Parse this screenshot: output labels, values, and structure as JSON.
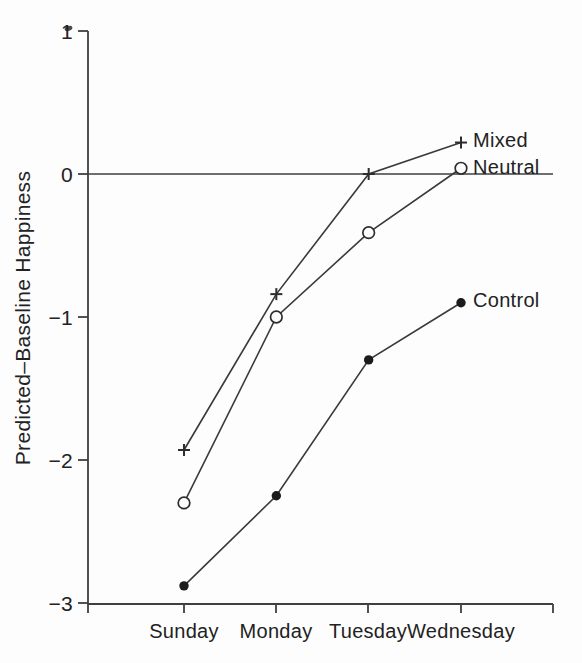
{
  "chart_data": {
    "type": "line",
    "title": "",
    "xlabel": "",
    "ylabel": "Predicted–Baseline Happiness",
    "categories": [
      "Sunday",
      "Monday",
      "Tuesday",
      "Wednesday"
    ],
    "ylim": [
      -3,
      1
    ],
    "yticks": [
      1,
      0,
      -1,
      -2,
      -3
    ],
    "ytick_labels": [
      "1",
      "0",
      "−1",
      "−2",
      "−3"
    ],
    "reference_line_y": 0,
    "grid": false,
    "legend_position": "right-of-last-point",
    "series": [
      {
        "name": "Mixed",
        "marker": "plus",
        "values": [
          -1.93,
          -0.84,
          0.0,
          0.22
        ]
      },
      {
        "name": "Neutral",
        "marker": "circle-open",
        "values": [
          -2.3,
          -1.0,
          -0.41,
          0.04
        ]
      },
      {
        "name": "Control",
        "marker": "circle-filled",
        "values": [
          -2.88,
          -2.25,
          -1.3,
          -0.9
        ]
      }
    ],
    "colors": {
      "ink": "#222222",
      "line": "#3a3a3a",
      "axis": "#3f3f3f",
      "marker": "#2d2d2d",
      "filled_marker": "#1b1b1b",
      "paper": "#fdfdfd"
    }
  }
}
